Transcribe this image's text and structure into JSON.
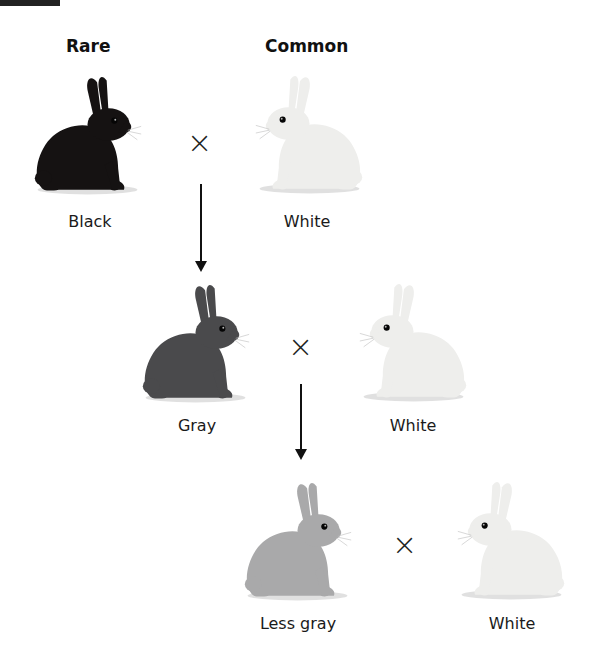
{
  "headings": {
    "left": "Rare",
    "right": "Common"
  },
  "generations": [
    {
      "left": {
        "label": "Black",
        "fur": "#151212",
        "shade": "#2a2424"
      },
      "right": {
        "label": "White",
        "fur": "#eeeeec",
        "shade": "#d6d4cf"
      }
    },
    {
      "left": {
        "label": "Gray",
        "fur": "#4a4a4c",
        "shade": "#2f2f31"
      },
      "right": {
        "label": "White",
        "fur": "#eeeeec",
        "shade": "#d6d4cf"
      }
    },
    {
      "left": {
        "label": "Less gray",
        "fur": "#a9a9aa",
        "shade": "#8a8a8c"
      },
      "right": {
        "label": "White",
        "fur": "#eeeeec",
        "shade": "#d6d4cf"
      }
    }
  ],
  "symbols": {
    "cross": "×"
  }
}
